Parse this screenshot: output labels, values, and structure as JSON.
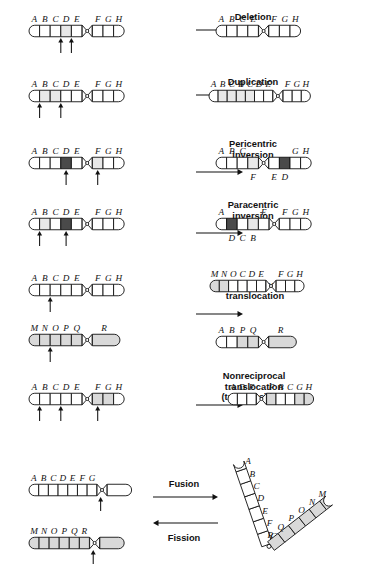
{
  "figure": {
    "type": "diagram"
  },
  "chart_data": {
    "type": "diagram",
    "rows": [
      {
        "operation": "Deletion",
        "before": [
          "A",
          "B",
          "C",
          "D",
          "E",
          "F",
          "G",
          "H"
        ],
        "after": [
          "A",
          "B",
          "C",
          "E",
          "F",
          "G",
          "H"
        ],
        "highlighted": [
          "D"
        ],
        "breakpoints": 2
      },
      {
        "operation": "Duplication",
        "before": [
          "A",
          "B",
          "C",
          "D",
          "E",
          "F",
          "G",
          "H"
        ],
        "after": [
          "A",
          "B",
          "C",
          "B",
          "C",
          "D",
          "E",
          "F",
          "G",
          "H"
        ],
        "highlighted": [
          "B",
          "C"
        ],
        "breakpoints": 2
      },
      {
        "operation": "Pericentric inversion",
        "before": [
          "A",
          "B",
          "C",
          "D",
          "E",
          "F",
          "G",
          "H"
        ],
        "after": [
          "A",
          "B",
          "C",
          "F",
          "E",
          "D",
          "G",
          "H"
        ],
        "highlighted": [
          "D",
          "F"
        ],
        "breakpoints": 2
      },
      {
        "operation": "Paracentric inversion",
        "before": [
          "A",
          "B",
          "C",
          "D",
          "E",
          "F",
          "G",
          "H"
        ],
        "after": [
          "A",
          "D",
          "C",
          "B",
          "E",
          "F",
          "G",
          "H"
        ],
        "highlighted": [
          "B",
          "D"
        ],
        "breakpoints": 2
      },
      {
        "operation": "Reciprocal translocation",
        "before": [
          [
            "A",
            "B",
            "C",
            "D",
            "E",
            "F",
            "G",
            "H"
          ],
          [
            "M",
            "N",
            "O",
            "P",
            "Q",
            "R"
          ]
        ],
        "after": [
          [
            "M",
            "N",
            "O",
            "C",
            "D",
            "E",
            "F",
            "G",
            "H"
          ],
          [
            "A",
            "B",
            "P",
            "Q",
            "R"
          ]
        ],
        "breakpoints": 2
      },
      {
        "operation": "Nonreciprocal translocation (transposition)",
        "before": [
          "A",
          "B",
          "C",
          "D",
          "E",
          "F",
          "G",
          "H"
        ],
        "after": [
          "A",
          "D",
          "E",
          "F",
          "B",
          "C",
          "G",
          "H"
        ],
        "highlighted": [
          "F",
          "G"
        ],
        "breakpoints": 3
      },
      {
        "operation": "Fusion / Fission",
        "before": [
          [
            "A",
            "B",
            "C",
            "D",
            "E",
            "F",
            "G"
          ],
          [
            "M",
            "N",
            "O",
            "P",
            "Q",
            "R"
          ]
        ],
        "after": [
          "A",
          "B",
          "C",
          "D",
          "E",
          "F",
          "G",
          "R",
          "Q",
          "P",
          "O",
          "N",
          "M"
        ],
        "breakpoints": 2
      }
    ]
  },
  "operations": {
    "deletion": "Deletion",
    "duplication": "Duplication",
    "pericentric_line1": "Pericentric",
    "pericentric_line2": "inversion",
    "paracentric_line1": "Paracentric",
    "paracentric_line2": "inversion",
    "reciprocal_line1": "Reciprocal",
    "reciprocal_line2": "translocation",
    "nonreciprocal_line1": "Nonreciprocal",
    "nonreciprocal_line2": "translocation",
    "nonreciprocal_line3": "(transposition)",
    "fusion": "Fusion",
    "fission": "Fission"
  },
  "row1": {
    "before": [
      "A",
      "B",
      "C",
      "D",
      "E",
      "F",
      "G",
      "H"
    ],
    "after": [
      "A",
      "B",
      "C",
      "E",
      "F",
      "G",
      "H"
    ]
  },
  "row2": {
    "before": [
      "A",
      "B",
      "C",
      "D",
      "E",
      "F",
      "G",
      "H"
    ],
    "after": [
      "A",
      "B",
      "C",
      "B",
      "C",
      "D",
      "E",
      "F",
      "G",
      "H"
    ]
  },
  "row3": {
    "before": [
      "A",
      "B",
      "C",
      "D",
      "E",
      "F",
      "G",
      "H"
    ],
    "after_top": [
      "A",
      "B",
      "C",
      "G",
      "H"
    ],
    "after_bottom": [
      "F",
      "E",
      "D"
    ]
  },
  "row4": {
    "before": [
      "A",
      "B",
      "C",
      "D",
      "E",
      "F",
      "G",
      "H"
    ],
    "after_top": [
      "A",
      "E",
      "F",
      "G",
      "H"
    ],
    "after_bottom": [
      "D",
      "C",
      "B"
    ]
  },
  "row5": {
    "before_top": [
      "A",
      "B",
      "C",
      "D",
      "E",
      "F",
      "G",
      "H"
    ],
    "before_bottom": [
      "M",
      "N",
      "O",
      "P",
      "Q",
      "R"
    ],
    "after_top": [
      "M",
      "N",
      "O",
      "C",
      "D",
      "E",
      "F",
      "G",
      "H"
    ],
    "after_bottom": [
      "A",
      "B",
      "P",
      "Q",
      "R"
    ]
  },
  "row6": {
    "before": [
      "A",
      "B",
      "C",
      "D",
      "E",
      "F",
      "G",
      "H"
    ],
    "after": [
      "A",
      "D",
      "E",
      "F",
      "B",
      "C",
      "G",
      "H"
    ]
  },
  "row7": {
    "before_top": [
      "A",
      "B",
      "C",
      "D",
      "E",
      "F",
      "G"
    ],
    "before_bottom": [
      "M",
      "N",
      "O",
      "P",
      "Q",
      "R"
    ],
    "after_left_arm": [
      "A",
      "B",
      "C",
      "D",
      "E",
      "F",
      "G"
    ],
    "after_right_arm": [
      "R",
      "Q",
      "P",
      "O",
      "N",
      "M"
    ]
  },
  "colors": {
    "outline": "#111111",
    "white_band": "#ffffff",
    "grey_band": "#d9d9d9",
    "light_band": "#e8e8e8",
    "dark_band": "#4a4a4a",
    "background": "#ffffff"
  }
}
